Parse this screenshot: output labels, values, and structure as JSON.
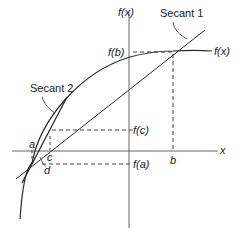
{
  "diagram": {
    "axes": {
      "y_label": "f(x)",
      "x_label": "x"
    },
    "curve_label": "f(x)",
    "secants": [
      {
        "label": "Secant 1"
      },
      {
        "label": "Secant 2"
      }
    ],
    "point_labels": {
      "a": "a",
      "b": "b",
      "c": "c",
      "d": "d"
    },
    "value_labels": {
      "fb": "f(b)",
      "fc": "f(c)",
      "fa": "f(a)"
    },
    "colors": {
      "line": "#2a2a2a",
      "axis": "#555555",
      "dash": "#444444"
    }
  }
}
